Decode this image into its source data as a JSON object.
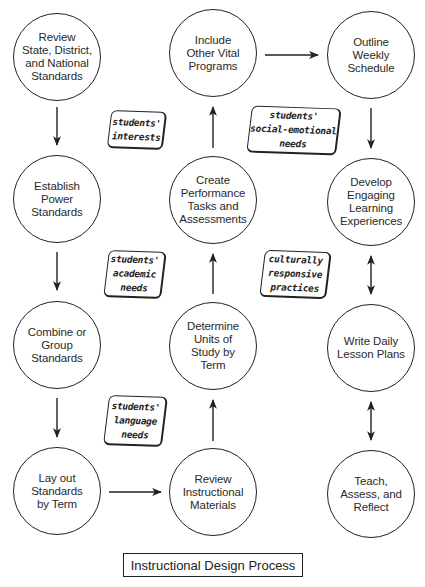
{
  "title": "Instructional Design Process",
  "colors": {
    "stroke": "#222222",
    "background": "#ffffff",
    "text": "#2a2a2a"
  },
  "nodes": [
    {
      "id": "review-standards",
      "label": "Review\nState, District,\nand National\nStandards"
    },
    {
      "id": "establish-power-standards",
      "label": "Establish\nPower\nStandards"
    },
    {
      "id": "combine-group-standards",
      "label": "Combine or\nGroup\nStandards"
    },
    {
      "id": "lay-out-standards",
      "label": "Lay out\nStandards\nby Term"
    },
    {
      "id": "review-instructional-materials",
      "label": "Review\nInstructional\nMaterials"
    },
    {
      "id": "determine-units",
      "label": "Determine\nUnits of\nStudy by\nTerm"
    },
    {
      "id": "create-performance-tasks",
      "label": "Create\nPerformance\nTasks and\nAssessments"
    },
    {
      "id": "include-other-programs",
      "label": "Include\nOther Vital\nPrograms"
    },
    {
      "id": "outline-weekly-schedule",
      "label": "Outline\nWeekly\nSchedule"
    },
    {
      "id": "develop-learning-experiences",
      "label": "Develop\nEngaging\nLearning\nExperiences"
    },
    {
      "id": "write-lesson-plans",
      "label": "Write Daily\nLesson Plans"
    },
    {
      "id": "teach-assess-reflect",
      "label": "Teach,\nAssess, and\nReflect"
    }
  ],
  "tags": [
    {
      "id": "students-interests",
      "label": "students'\ninterests"
    },
    {
      "id": "students-social-emotional-needs",
      "label": "students'\nsocial-emotional\nneeds"
    },
    {
      "id": "students-academic-needs",
      "label": "students'\nacademic\nneeds"
    },
    {
      "id": "culturally-responsive-practices",
      "label": "culturally\nresponsive\npractices"
    },
    {
      "id": "students-language-needs",
      "label": "students'\nlanguage\nneeds"
    }
  ],
  "edges": [
    {
      "from": "review-standards",
      "to": "establish-power-standards",
      "direction": "down"
    },
    {
      "from": "establish-power-standards",
      "to": "combine-group-standards",
      "direction": "down"
    },
    {
      "from": "combine-group-standards",
      "to": "lay-out-standards",
      "direction": "down"
    },
    {
      "from": "lay-out-standards",
      "to": "review-instructional-materials",
      "direction": "right"
    },
    {
      "from": "review-instructional-materials",
      "to": "determine-units",
      "direction": "up"
    },
    {
      "from": "determine-units",
      "to": "create-performance-tasks",
      "direction": "up"
    },
    {
      "from": "create-performance-tasks",
      "to": "include-other-programs",
      "direction": "up"
    },
    {
      "from": "include-other-programs",
      "to": "outline-weekly-schedule",
      "direction": "right"
    },
    {
      "from": "outline-weekly-schedule",
      "to": "develop-learning-experiences",
      "direction": "down"
    },
    {
      "from": "develop-learning-experiences",
      "to": "write-lesson-plans",
      "direction": "bidirectional"
    },
    {
      "from": "write-lesson-plans",
      "to": "teach-assess-reflect",
      "direction": "bidirectional"
    }
  ]
}
